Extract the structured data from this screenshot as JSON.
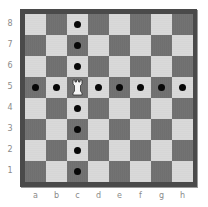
{
  "board": {
    "files": [
      "a",
      "b",
      "c",
      "d",
      "e",
      "f",
      "g",
      "h"
    ],
    "ranks": [
      "8",
      "7",
      "6",
      "5",
      "4",
      "3",
      "2",
      "1"
    ],
    "colors": {
      "light": "#dadada",
      "dark": "#6e6e6e",
      "frame": "#4a4a4a",
      "dot": "#080808"
    },
    "pieces": [
      {
        "square": "c5",
        "type": "rook",
        "color": "white"
      }
    ],
    "highlighted_moves": [
      "c8",
      "c7",
      "c6",
      "c4",
      "c3",
      "c2",
      "c1",
      "a5",
      "b5",
      "d5",
      "e5",
      "f5",
      "g5",
      "h5"
    ]
  }
}
